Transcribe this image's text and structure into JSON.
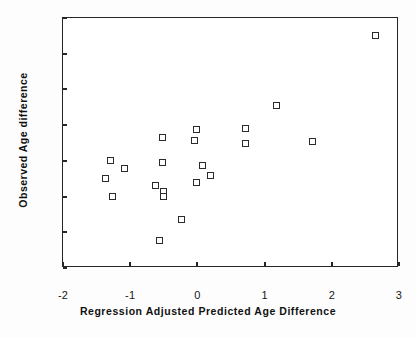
{
  "chart_data": {
    "type": "scatter",
    "title": "",
    "xlabel": "Regression Adjusted Predicted Age Difference",
    "ylabel": "Observed Age difference",
    "xlim": [
      -2,
      3
    ],
    "ylim": [
      -3,
      4
    ],
    "xticks": [
      -2,
      -1,
      0,
      1,
      2,
      3
    ],
    "xtick_labels": [
      "-2",
      "-1",
      "0",
      "1",
      "2",
      "3"
    ],
    "yticks": [
      -3,
      -2,
      -1,
      0,
      1,
      2,
      3,
      4
    ],
    "ytick_labels": [
      "-3",
      "-2",
      "-1",
      "0",
      "1",
      "2",
      "3",
      "4"
    ],
    "grid": false,
    "legend": null,
    "marker": "open-square",
    "marker_color": "#2b2b2b",
    "series": [
      {
        "name": "Subjects",
        "points": [
          [
            -1.3,
            0.0
          ],
          [
            -1.09,
            -0.2
          ],
          [
            -1.37,
            -0.5
          ],
          [
            -1.27,
            -1.0
          ],
          [
            -0.63,
            -0.68
          ],
          [
            -0.52,
            0.66
          ],
          [
            -0.52,
            -0.04
          ],
          [
            -0.5,
            -0.85
          ],
          [
            -0.5,
            -1.0
          ],
          [
            -0.57,
            -2.22
          ],
          [
            -0.24,
            -1.63
          ],
          [
            -0.02,
            0.87
          ],
          [
            -0.04,
            0.57
          ],
          [
            -0.02,
            -0.6
          ],
          [
            0.07,
            -0.14
          ],
          [
            0.19,
            -0.41
          ],
          [
            0.71,
            0.9
          ],
          [
            0.71,
            0.5
          ],
          [
            1.17,
            1.54
          ],
          [
            1.71,
            0.54
          ],
          [
            2.65,
            3.5
          ]
        ]
      }
    ]
  }
}
